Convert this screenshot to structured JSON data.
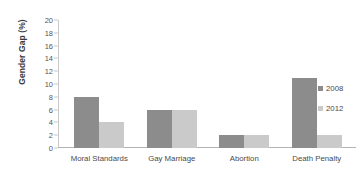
{
  "chart_data": {
    "type": "bar",
    "title": "",
    "xlabel": "",
    "ylabel": "Gender Gap (%)",
    "ylim": [
      0,
      20
    ],
    "ytick_step": 2,
    "yticks": [
      20,
      18,
      16,
      14,
      12,
      10,
      8,
      6,
      4,
      2,
      0
    ],
    "grid": false,
    "legend_position": "right",
    "categories": [
      "Moral Standards",
      "Gay Marriage",
      "Abortion",
      "Death Penalty"
    ],
    "series": [
      {
        "name": "2008",
        "color": "#8c8c8c",
        "values": [
          8,
          6,
          2,
          11
        ]
      },
      {
        "name": "2012",
        "color": "#cacaca",
        "values": [
          4,
          6,
          2,
          2
        ]
      }
    ]
  },
  "axis": {
    "y_title": "Gender Gap (%)"
  },
  "legend": {
    "items": [
      {
        "label": "2008",
        "color": "#8c8c8c"
      },
      {
        "label": "2012",
        "color": "#cacaca"
      }
    ]
  }
}
